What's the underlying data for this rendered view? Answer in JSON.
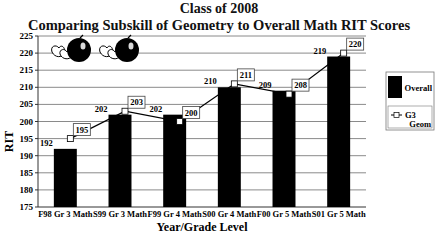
{
  "chart_data": {
    "type": "bar",
    "title": "Class of 2008",
    "subtitle": "Comparing Subskill of Geometry to Overall Math RIT Scores",
    "xlabel": "Year/Grade Level",
    "ylabel": "RIT",
    "ylim": [
      175,
      225
    ],
    "yticks": [
      175,
      180,
      185,
      190,
      195,
      200,
      205,
      210,
      215,
      220,
      225
    ],
    "grid": true,
    "legend_position": "right",
    "categories": [
      "F98 Gr 3 Math",
      "S99 Gr 3 Math",
      "F99 Gr 4 Math",
      "S00 Gr 4 Math",
      "F00 Gr 5 Math",
      "S01 Gr 5 Math"
    ],
    "series": [
      {
        "name": "Overall",
        "type": "bar",
        "color": "#000000",
        "values": [
          192,
          202,
          202,
          210,
          209,
          219
        ]
      },
      {
        "name": "G3 Geom",
        "type": "line",
        "marker": "open-square",
        "color": "#000000",
        "values": [
          195,
          203,
          200,
          211,
          208,
          220
        ]
      }
    ]
  },
  "header": {
    "title": "Class of 2008",
    "subtitle": "Comparing Subskill of Geometry to Overall Math RIT Scores"
  },
  "axes": {
    "ylabel": "RIT",
    "xlabel": "Year/Grade Level"
  },
  "legend": {
    "overall_label": "Overall",
    "geom_label_line1": "G3",
    "geom_label_line2": "Geom"
  },
  "decorations": {
    "clipart": "apple-and-cut-apples-icon",
    "count": 2
  }
}
